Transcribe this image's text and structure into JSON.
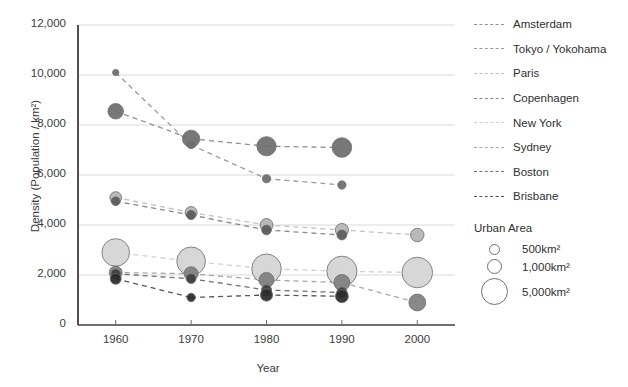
{
  "chart_data": {
    "type": "scatter",
    "title": "",
    "xlabel": "Year",
    "ylabel": "Density (Population / km²)",
    "x": [
      1960,
      1970,
      1980,
      1990,
      2000
    ],
    "xtick_labels": [
      "1960",
      "1970",
      "1980",
      "1990",
      "2000"
    ],
    "ytick_labels": [
      "0",
      "2,000",
      "4,000",
      "6,000",
      "8,000",
      "10,000",
      "12,000"
    ],
    "ytick_values": [
      0,
      2000,
      4000,
      6000,
      8000,
      10000,
      12000
    ],
    "ylim": [
      0,
      12000
    ],
    "xlim": [
      1955,
      2005
    ],
    "grid": "horizontal",
    "legend_position": "right",
    "size_legend": {
      "title": "Urban Area",
      "entries": [
        {
          "label": "500km²",
          "value": 500,
          "px": 9
        },
        {
          "label": "1,000km²",
          "value": 1000,
          "px": 13
        },
        {
          "label": "5,000km²",
          "value": 5000,
          "px": 25
        }
      ]
    },
    "series": [
      {
        "name": "Amsterdam",
        "color": "#6e6e6e",
        "line_color": "#8f8f8f",
        "points": [
          {
            "x": 1960,
            "y": 8550,
            "area": 1400
          },
          {
            "x": 1970,
            "y": 7450,
            "area": 1800
          },
          {
            "x": 1980,
            "y": 7150,
            "area": 2300
          },
          {
            "x": 1990,
            "y": 7100,
            "area": 2400
          }
        ]
      },
      {
        "name": "Tokyo / Yokohama",
        "color": "#6e6e6e",
        "line_color": "#9a9a9a",
        "points": [
          {
            "x": 1960,
            "y": 10100,
            "area": 120
          },
          {
            "x": 1970,
            "y": 7200,
            "area": 200
          },
          {
            "x": 1980,
            "y": 5850,
            "area": 260
          },
          {
            "x": 1990,
            "y": 5600,
            "area": 280
          }
        ]
      },
      {
        "name": "Paris",
        "color": "#b4b4b4",
        "line_color": "#c2c2c2",
        "points": [
          {
            "x": 1960,
            "y": 5100,
            "area": 700
          },
          {
            "x": 1970,
            "y": 4500,
            "area": 750
          },
          {
            "x": 1980,
            "y": 4000,
            "area": 900
          },
          {
            "x": 1990,
            "y": 3800,
            "area": 950
          },
          {
            "x": 2000,
            "y": 3600,
            "area": 1000
          }
        ]
      },
      {
        "name": "Copenhagen",
        "color": "#5a5a5a",
        "line_color": "#8a8a8a",
        "points": [
          {
            "x": 1960,
            "y": 4950,
            "area": 330
          },
          {
            "x": 1970,
            "y": 4400,
            "area": 380
          },
          {
            "x": 1980,
            "y": 3800,
            "area": 430
          },
          {
            "x": 1990,
            "y": 3600,
            "area": 450
          }
        ]
      },
      {
        "name": "New York",
        "color": "#d4d4d4",
        "line_color": "#d0d0d0",
        "points": [
          {
            "x": 1960,
            "y": 2900,
            "area": 5200
          },
          {
            "x": 1970,
            "y": 2550,
            "area": 5600
          },
          {
            "x": 1980,
            "y": 2250,
            "area": 6000
          },
          {
            "x": 1990,
            "y": 2150,
            "area": 6300
          },
          {
            "x": 2000,
            "y": 2100,
            "area": 6500
          }
        ]
      },
      {
        "name": "Sydney",
        "color": "#808080",
        "line_color": "#a8a8a8",
        "points": [
          {
            "x": 1960,
            "y": 2100,
            "area": 900
          },
          {
            "x": 1970,
            "y": 2050,
            "area": 1100
          },
          {
            "x": 1980,
            "y": 1800,
            "area": 1300
          },
          {
            "x": 1990,
            "y": 1700,
            "area": 1500
          },
          {
            "x": 2000,
            "y": 900,
            "area": 1700
          }
        ]
      },
      {
        "name": "Boston",
        "color": "#3d3d3d",
        "line_color": "#707070",
        "points": [
          {
            "x": 1960,
            "y": 2050,
            "area": 380
          },
          {
            "x": 1970,
            "y": 1850,
            "area": 420
          },
          {
            "x": 1980,
            "y": 1400,
            "area": 500
          },
          {
            "x": 1990,
            "y": 1300,
            "area": 520
          }
        ]
      },
      {
        "name": "Brisbane",
        "color": "#2b2b2b",
        "line_color": "#555555",
        "points": [
          {
            "x": 1960,
            "y": 1850,
            "area": 600
          },
          {
            "x": 1970,
            "y": 1100,
            "area": 300
          },
          {
            "x": 1980,
            "y": 1200,
            "area": 800
          },
          {
            "x": 1990,
            "y": 1150,
            "area": 900
          }
        ]
      }
    ]
  }
}
